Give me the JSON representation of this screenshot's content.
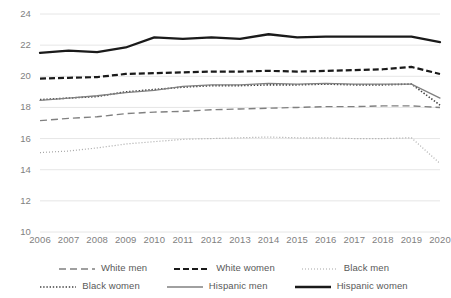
{
  "chart_data": {
    "type": "line",
    "title": "",
    "subtitle": "",
    "xlabel": "",
    "ylabel": "",
    "x": [
      2006,
      2007,
      2008,
      2009,
      2010,
      2011,
      2012,
      2013,
      2014,
      2015,
      2016,
      2017,
      2018,
      2019,
      2020
    ],
    "categories": [
      "2006",
      "2007",
      "2008",
      "2009",
      "2010",
      "2011",
      "2012",
      "2013",
      "2014",
      "2015",
      "2016",
      "2017",
      "2018",
      "2019",
      "2020"
    ],
    "ylim": [
      10,
      24
    ],
    "yticks": [
      10,
      12,
      14,
      16,
      18,
      20,
      22,
      24
    ],
    "ytick_labels": [
      "10",
      "12",
      "14",
      "16",
      "18",
      "20",
      "22",
      "24"
    ],
    "grid": "horizontal",
    "legend_position": "bottom",
    "series": [
      {
        "name": "White men",
        "style": "long-dash",
        "color": "#808080",
        "width": 1.4,
        "dasharray": "7 4",
        "values": [
          17.15,
          17.3,
          17.4,
          17.6,
          17.7,
          17.75,
          17.85,
          17.9,
          17.95,
          18.0,
          18.05,
          18.05,
          18.1,
          18.1,
          18.0
        ]
      },
      {
        "name": "White women",
        "style": "thick-dash",
        "color": "#1a1a1a",
        "width": 2.2,
        "dasharray": "6 3",
        "values": [
          19.85,
          19.9,
          19.95,
          20.15,
          20.2,
          20.25,
          20.3,
          20.3,
          20.35,
          20.3,
          20.35,
          20.4,
          20.45,
          20.6,
          20.15
        ]
      },
      {
        "name": "Black men",
        "style": "fine-dot",
        "color": "#a6a6a6",
        "width": 1.2,
        "dasharray": "1 2",
        "values": [
          15.1,
          15.2,
          15.4,
          15.65,
          15.8,
          15.95,
          16.0,
          16.05,
          16.1,
          16.05,
          16.05,
          16.0,
          16.0,
          16.05,
          14.4
        ]
      },
      {
        "name": "Black women",
        "style": "dot",
        "color": "#404040",
        "width": 1.6,
        "dasharray": "1.4 1.8",
        "values": [
          18.5,
          18.6,
          18.7,
          19.0,
          19.15,
          19.3,
          19.4,
          19.4,
          19.45,
          19.45,
          19.5,
          19.45,
          19.45,
          19.5,
          18.15
        ]
      },
      {
        "name": "Hispanic men",
        "style": "solid-thin",
        "color": "#808080",
        "width": 1.3,
        "dasharray": "",
        "values": [
          18.45,
          18.6,
          18.75,
          18.95,
          19.1,
          19.35,
          19.45,
          19.45,
          19.55,
          19.5,
          19.55,
          19.5,
          19.5,
          19.5,
          18.6
        ]
      },
      {
        "name": "Hispanic women",
        "style": "solid-thick",
        "color": "#1a1a1a",
        "width": 2.3,
        "dasharray": "",
        "values": [
          21.5,
          21.65,
          21.55,
          21.85,
          22.5,
          22.4,
          22.5,
          22.4,
          22.7,
          22.5,
          22.55,
          22.55,
          22.55,
          22.55,
          22.2
        ]
      }
    ]
  },
  "legend": {
    "row1": [
      {
        "label": "White men",
        "series": 0
      },
      {
        "label": "White women",
        "series": 1
      },
      {
        "label": "Black men",
        "series": 2
      }
    ],
    "row2": [
      {
        "label": "Black women",
        "series": 3
      },
      {
        "label": "Hispanic men",
        "series": 4
      },
      {
        "label": "Hispanic women",
        "series": 5
      }
    ]
  },
  "colors": {
    "grid": "#e6e6e6",
    "axis_text": "#7f7f7f",
    "legend_text": "#595959",
    "background": "#ffffff"
  }
}
